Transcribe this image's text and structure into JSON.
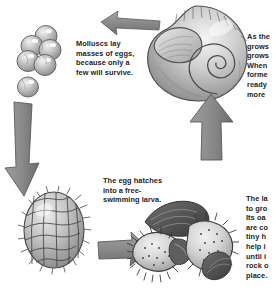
{
  "figure": {
    "style": "grayscale pencil illustration",
    "background_color": "#ffffff",
    "arrow_color": "#8c8c8c",
    "text_color": "#242424"
  },
  "captions": {
    "eggs": "Molluscs lay\nmasses of eggs,\nbecause only a\nfew will survive.",
    "shell": "As the\ngrows\ngrows\nWhen\nforme\nready\nmore",
    "larva": "The egg hatches\ninto a free-\nswimming larva.",
    "veliger": "The la\nto gro\nIts oa\nare co\ntiny h\nhelp i\nuntil i\nrock o\nplace."
  },
  "stages": [
    {
      "id": "eggs",
      "label": "egg-mass",
      "description": "cluster of five spherical eggs with a sixth below"
    },
    {
      "id": "larva",
      "label": "trochophore-larva",
      "description": "spiky oval free-swimming larva"
    },
    {
      "id": "veliger",
      "label": "veliger-larva",
      "description": "larva with two ciliated velum lobes"
    },
    {
      "id": "shell",
      "label": "adult-shell",
      "description": "coiled spiral mollusc shell"
    }
  ],
  "arrows": [
    {
      "id": "arrow-top",
      "direction": "left",
      "from": "shell",
      "to": "eggs"
    },
    {
      "id": "arrow-left",
      "direction": "down",
      "from": "eggs",
      "to": "larva"
    },
    {
      "id": "arrow-bottom",
      "direction": "right",
      "from": "larva",
      "to": "veliger"
    },
    {
      "id": "arrow-right",
      "direction": "up",
      "from": "veliger",
      "to": "shell"
    }
  ]
}
